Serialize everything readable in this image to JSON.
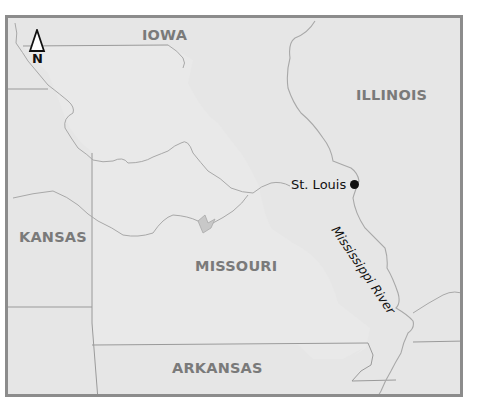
{
  "map": {
    "states": [
      {
        "name": "IOWA"
      },
      {
        "name": "ILLINOIS"
      },
      {
        "name": "KANSAS"
      },
      {
        "name": "MISSOURI"
      },
      {
        "name": "ARKANSAS"
      }
    ],
    "city": {
      "name": "St. Louis",
      "marker": "dot"
    },
    "river": {
      "name": "Mississippi River"
    },
    "north_arrow": {
      "label": "N",
      "icon": "north-arrow-icon"
    },
    "colors": {
      "background": "#e6e6e6",
      "frame": "#8c8c8c",
      "state_label": "#7a7a7a",
      "borders": "#9a9a9a",
      "rivers": "#a8a8a8",
      "text": "#111111"
    }
  }
}
